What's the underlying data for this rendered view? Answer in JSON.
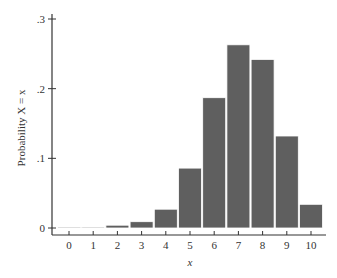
{
  "chart_data": {
    "type": "bar",
    "title": "",
    "xlabel": "x",
    "ylabel": "Probability X = x",
    "categories": [
      "0",
      "1",
      "2",
      "3",
      "4",
      "5",
      "6",
      "7",
      "8",
      "9",
      "10"
    ],
    "values": [
      0.0001,
      0.001,
      0.004,
      0.009,
      0.027,
      0.086,
      0.187,
      0.263,
      0.242,
      0.132,
      0.034
    ],
    "ylim": [
      0,
      0.3
    ],
    "yticks": [
      0,
      0.1,
      0.2,
      0.3
    ],
    "ytick_labels": [
      "0",
      ".1",
      ".2",
      ".3"
    ],
    "grid": false,
    "legend": null,
    "bar_color": "#5f5f5f",
    "axis_color": "#333333"
  }
}
